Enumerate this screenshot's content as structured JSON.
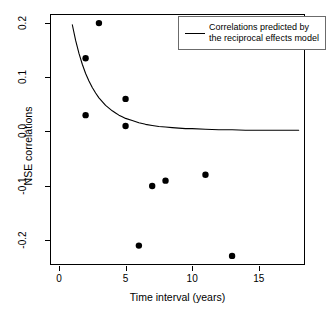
{
  "chart_data": {
    "type": "scatter",
    "title": "",
    "xlabel": "Time interval (years)",
    "ylabel": "NSE correlations",
    "xlim": [
      -0.6,
      18.4
    ],
    "ylim": [
      -0.245,
      0.215
    ],
    "grid": false,
    "xticks": [
      0,
      5,
      10,
      15
    ],
    "xtick_labels": [
      "0",
      "5",
      "10",
      "15"
    ],
    "yticks": [
      0.2,
      0.1,
      0.0,
      -0.1,
      -0.2
    ],
    "ytick_labels": [
      "0.2",
      "0.1",
      "0.0",
      "-0.1",
      "-0.2"
    ],
    "legend": {
      "position": "top-right",
      "entries": [
        {
          "marker": "line",
          "label_line1": "Correlations predicted by",
          "label_line2": "the reciprocal effects model",
          "color": "#000000"
        }
      ]
    },
    "series": [
      {
        "name": "NSE correlations (observed)",
        "type": "scatter",
        "marker": "filled-circle",
        "color": "#000000",
        "points": [
          {
            "x": 2,
            "y": 0.135
          },
          {
            "x": 2,
            "y": 0.03
          },
          {
            "x": 3,
            "y": 0.2
          },
          {
            "x": 5,
            "y": 0.06
          },
          {
            "x": 5,
            "y": 0.01
          },
          {
            "x": 6,
            "y": -0.211
          },
          {
            "x": 7,
            "y": -0.101
          },
          {
            "x": 8,
            "y": -0.091
          },
          {
            "x": 11,
            "y": -0.08
          },
          {
            "x": 13,
            "y": -0.23
          }
        ]
      },
      {
        "name": "Correlations predicted by the reciprocal effects model",
        "type": "line",
        "color": "#000000",
        "x": [
          1.0,
          1.25,
          1.5,
          1.75,
          2.0,
          2.25,
          2.5,
          2.75,
          3.0,
          3.25,
          3.5,
          3.75,
          4.0,
          4.25,
          4.5,
          4.75,
          5.0,
          5.5,
          6.0,
          6.5,
          7.0,
          7.5,
          8.0,
          8.5,
          9.0,
          9.5,
          10.0,
          11.0,
          12.0,
          13.0,
          14.0,
          15.0,
          16.0,
          17.0,
          18.0
        ],
        "y": [
          0.197,
          0.168,
          0.144,
          0.124,
          0.107,
          0.093,
          0.081,
          0.071,
          0.062,
          0.055,
          0.048,
          0.043,
          0.038,
          0.034,
          0.03,
          0.027,
          0.024,
          0.02,
          0.016,
          0.013,
          0.011,
          0.009,
          0.008,
          0.007,
          0.006,
          0.005,
          0.005,
          0.004,
          0.003,
          0.003,
          0.002,
          0.002,
          0.002,
          0.002,
          0.002
        ]
      }
    ]
  }
}
